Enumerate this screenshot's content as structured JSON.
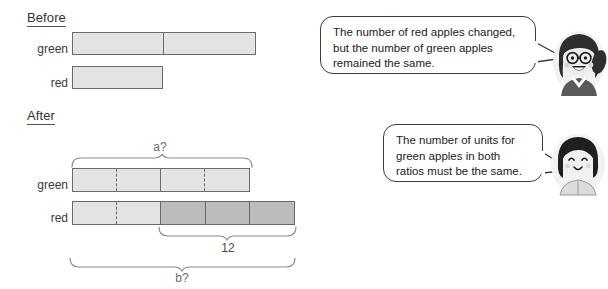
{
  "sections": {
    "before": {
      "heading": "Before",
      "rows": [
        {
          "label": "green",
          "units": 2
        },
        {
          "label": "red",
          "units": 1
        }
      ]
    },
    "after": {
      "heading": "After",
      "rows": [
        {
          "label": "green",
          "units": 4
        },
        {
          "label": "red",
          "units": 5
        }
      ]
    }
  },
  "annotations": {
    "bracket_a": "a?",
    "bracket_twelve": "12",
    "bracket_b": "b?"
  },
  "bubbles": [
    {
      "name": "bubble-red-apples-changed",
      "lines": [
        "The number of red apples changed,",
        "but the number of green apples",
        "remained the same."
      ],
      "speaker": "girl-with-glasses-avatar"
    },
    {
      "name": "bubble-units-must-match",
      "lines": [
        "The number of units for",
        "green apples in both",
        "ratios must be the same."
      ],
      "speaker": "girl-bob-haircut-avatar"
    }
  ],
  "colors": {
    "bar_fill_light": "#e3e3e3",
    "bar_fill_dark": "#bcbcbc",
    "bar_stroke": "#6a6a6a",
    "brace_stroke": "#8a8a8a",
    "bubble_stroke": "#3c3c3c",
    "text": "#2b2b2b"
  }
}
